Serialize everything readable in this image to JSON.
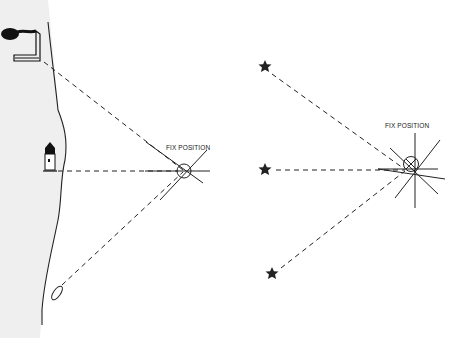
{
  "diagram": {
    "type": "navigation fix diagrams",
    "panels": [
      {
        "name": "terrestrial-fix",
        "landmarks": [
          "factory-chimney",
          "lighthouse",
          "rock"
        ],
        "label": "FIX POSITION"
      },
      {
        "name": "celestial-fix",
        "landmarks": [
          "star",
          "star",
          "star"
        ],
        "label": "FIX POSITION"
      }
    ]
  },
  "left_panel": {
    "fix_label": "FIX POSITION"
  },
  "right_panel": {
    "fix_label": "FIX POSITION"
  },
  "colors": {
    "ink": "#222222",
    "land": "#efefef",
    "background": "#ffffff"
  }
}
